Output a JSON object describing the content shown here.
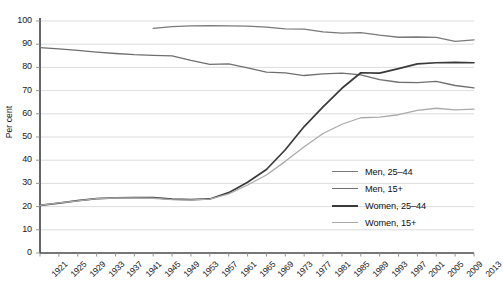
{
  "chart_data": {
    "type": "line",
    "title": "",
    "subtitle": "",
    "xlabel": "",
    "ylabel": "Per cent",
    "ylim": [
      0,
      100
    ],
    "ytick_step": 10,
    "yticks": [
      0,
      10,
      20,
      30,
      40,
      50,
      60,
      70,
      80,
      90,
      100
    ],
    "xlim": [
      1921,
      2013
    ],
    "xtick_step": 4,
    "categories": [
      1921,
      1925,
      1929,
      1933,
      1937,
      1941,
      1945,
      1949,
      1953,
      1957,
      1961,
      1965,
      1969,
      1973,
      1977,
      1981,
      1985,
      1989,
      1993,
      1997,
      2001,
      2005,
      2009,
      2013
    ],
    "grid": "horizontal",
    "legend_position": "inside-lower-right",
    "series": [
      {
        "name": "Men, 25–44",
        "color": "#7a7a7a",
        "x": [
          1945,
          1949,
          1953,
          1957,
          1961,
          1965,
          1969,
          1973,
          1977,
          1981,
          1985,
          1989,
          1993,
          1997,
          2001,
          2005,
          2009,
          2013
        ],
        "values": [
          96.8,
          97.6,
          97.9,
          98.0,
          97.9,
          97.8,
          97.4,
          96.6,
          96.5,
          95.3,
          94.8,
          95.0,
          93.9,
          93.0,
          93.1,
          92.9,
          91.2,
          91.9
        ]
      },
      {
        "name": "Men, 15+",
        "color": "#6f6f6f",
        "x": [
          1921,
          1925,
          1929,
          1933,
          1937,
          1941,
          1945,
          1949,
          1953,
          1957,
          1961,
          1965,
          1969,
          1973,
          1977,
          1981,
          1985,
          1989,
          1993,
          1997,
          2001,
          2005,
          2009,
          2013
        ],
        "values": [
          88.5,
          88.0,
          87.3,
          86.6,
          86.0,
          85.5,
          85.2,
          85.0,
          83.0,
          81.3,
          81.5,
          79.8,
          78.0,
          77.6,
          76.5,
          77.2,
          77.5,
          76.8,
          74.7,
          73.6,
          73.4,
          74.0,
          72.2,
          71.2
        ]
      },
      {
        "name": "Women, 25–44",
        "color": "#3a3a3a",
        "x": [
          1921,
          1925,
          1929,
          1933,
          1937,
          1941,
          1945,
          1949,
          1953,
          1957,
          1961,
          1965,
          1969,
          1973,
          1977,
          1981,
          1985,
          1989,
          1993,
          1997,
          2001,
          2005,
          2009,
          2013
        ],
        "values": [
          20.5,
          21.5,
          22.6,
          23.4,
          23.8,
          23.9,
          23.9,
          23.2,
          23.0,
          23.3,
          26.0,
          30.5,
          36.0,
          44.5,
          54.5,
          63.0,
          71.0,
          77.7,
          77.5,
          79.5,
          81.5,
          82.0,
          82.2,
          82.0
        ]
      },
      {
        "name": "Women, 15+",
        "color": "#aaaaaa",
        "x": [
          1921,
          1925,
          1929,
          1933,
          1937,
          1941,
          1945,
          1949,
          1953,
          1957,
          1961,
          1965,
          1969,
          1973,
          1977,
          1981,
          1985,
          1989,
          1993,
          1997,
          2001,
          2005,
          2009,
          2013
        ],
        "values": [
          20.5,
          21.6,
          22.5,
          23.4,
          23.7,
          23.8,
          23.6,
          23.0,
          22.9,
          23.2,
          25.5,
          29.3,
          33.6,
          39.5,
          45.8,
          51.5,
          55.5,
          58.3,
          58.6,
          59.6,
          61.5,
          62.4,
          61.7,
          62.0
        ]
      }
    ]
  },
  "axis": {
    "y_label": "Per cent"
  }
}
